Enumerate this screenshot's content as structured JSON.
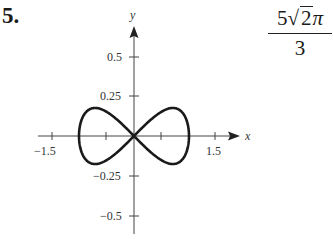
{
  "problem": {
    "number_label": "5.",
    "answer": {
      "numerator_coef": "5",
      "numerator_radicand": "2",
      "numerator_pi": "π",
      "denominator": "3",
      "text": "5√2π/3"
    }
  },
  "chart_data": {
    "type": "line",
    "title": "",
    "xlabel": "x",
    "ylabel": "y",
    "xlim": [
      -1.5,
      1.5
    ],
    "ylim": [
      -0.5,
      0.5
    ],
    "x_ticks": [
      -1.5,
      -0.5,
      0.5,
      1.5
    ],
    "x_tick_labels": [
      "-1.5",
      "1.5"
    ],
    "y_ticks": [
      0.5,
      0.25,
      -0.25,
      -0.5
    ],
    "y_tick_labels": [
      "0.5",
      "0.25",
      "−0.25",
      "−0.5"
    ],
    "grid": false,
    "legend": null,
    "series": [
      {
        "name": "figure-eight curve",
        "parametric": "x = cos t, y ≈ 0.35 sin t cos t, 0 ≤ t ≤ 2π",
        "points": [
          {
            "x": 1.0,
            "y": 0.0
          },
          {
            "x": 0.707,
            "y": 0.175
          },
          {
            "x": 0.0,
            "y": 0.0
          },
          {
            "x": -0.707,
            "y": -0.175
          },
          {
            "x": -1.0,
            "y": 0.0
          },
          {
            "x": -0.707,
            "y": 0.175
          },
          {
            "x": 0.0,
            "y": 0.0
          },
          {
            "x": 0.707,
            "y": -0.175
          },
          {
            "x": 1.0,
            "y": 0.0
          }
        ]
      }
    ],
    "color": "#1a1a1a"
  }
}
